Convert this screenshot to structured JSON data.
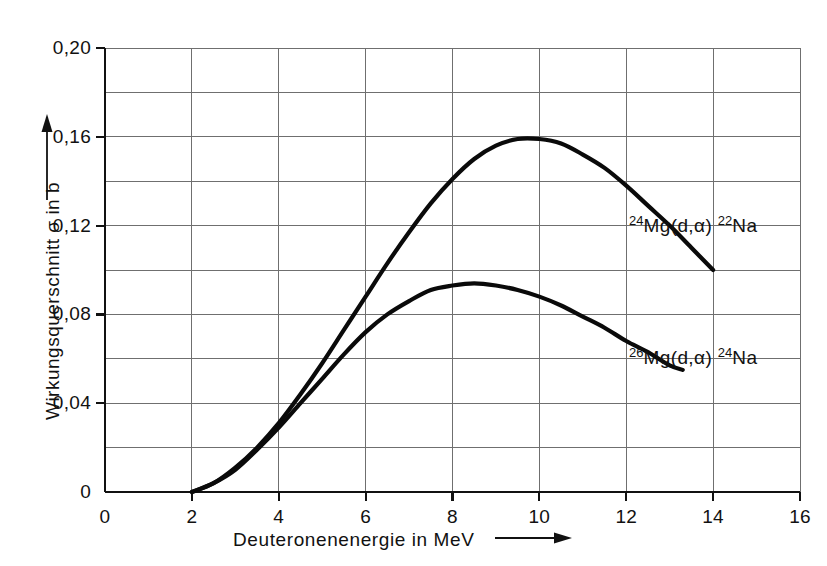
{
  "chart_data": {
    "type": "line",
    "title": "",
    "xlabel": "Deuteronenenergie in MeV",
    "ylabel": "Wirkungsquerschnitt σ in b",
    "xlim": [
      0,
      16
    ],
    "ylim": [
      0,
      0.2
    ],
    "grid": true,
    "legend_position": "inline-annotations",
    "x_ticks": [
      "0",
      "2",
      "4",
      "6",
      "8",
      "10",
      "12",
      "14",
      "16"
    ],
    "x_tick_values": [
      0,
      2,
      4,
      6,
      8,
      10,
      12,
      14,
      16
    ],
    "y_ticks": [
      "0",
      "0,04",
      "0,08",
      "0,12",
      "0,16",
      "0,20"
    ],
    "y_tick_values": [
      0,
      0.04,
      0.08,
      0.12,
      0.16,
      0.2
    ],
    "x_minor_step": 2,
    "y_minor_step": 0.02,
    "series": [
      {
        "name": "24Mg(d,α) 22Na",
        "label_prefix_sup": "24",
        "label_mid": "Mg(d,α)",
        "label_suffix_sup": "22",
        "label_end": "Na",
        "x": [
          2.0,
          2.5,
          3.0,
          3.5,
          4.0,
          4.5,
          5.0,
          5.5,
          6.0,
          6.5,
          7.0,
          7.5,
          8.0,
          8.5,
          9.0,
          9.5,
          10.0,
          10.5,
          11.0,
          11.5,
          12.0,
          12.5,
          13.0,
          13.5,
          14.0
        ],
        "y": [
          0.0,
          0.004,
          0.011,
          0.02,
          0.031,
          0.044,
          0.058,
          0.073,
          0.088,
          0.103,
          0.117,
          0.13,
          0.141,
          0.15,
          0.156,
          0.159,
          0.159,
          0.157,
          0.152,
          0.146,
          0.138,
          0.129,
          0.12,
          0.11,
          0.1
        ]
      },
      {
        "name": "26Mg(d,α) 24Na",
        "label_prefix_sup": "26",
        "label_mid": "Mg(d,α)",
        "label_suffix_sup": "24",
        "label_end": "Na",
        "x": [
          2.0,
          2.5,
          3.0,
          3.5,
          4.0,
          4.5,
          5.0,
          5.5,
          6.0,
          6.5,
          7.0,
          7.5,
          8.0,
          8.5,
          9.0,
          9.5,
          10.0,
          10.5,
          11.0,
          11.5,
          12.0,
          12.5,
          13.0,
          13.3
        ],
        "y": [
          0.0,
          0.004,
          0.01,
          0.019,
          0.029,
          0.04,
          0.051,
          0.062,
          0.072,
          0.08,
          0.086,
          0.091,
          0.093,
          0.094,
          0.093,
          0.091,
          0.088,
          0.084,
          0.079,
          0.074,
          0.068,
          0.063,
          0.057,
          0.055
        ]
      }
    ],
    "axis_arrows": {
      "x_arrow": "right-arrow",
      "y_arrow": "up-arrow"
    },
    "colors": {
      "curve": "#0a0a0a",
      "axis": "#111111",
      "grid": "#6f6f6f",
      "background": "#ffffff"
    }
  }
}
